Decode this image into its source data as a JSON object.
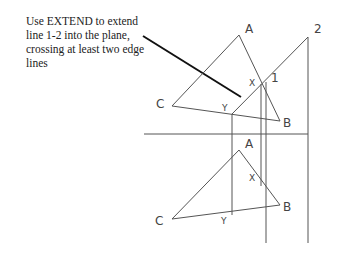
{
  "instruction": {
    "lines": [
      "Use EXTEND to  extend",
      "line 1-2 into the plane,",
      "crossing at least two edge",
      "lines"
    ]
  },
  "top_view": {
    "labels": {
      "A": "A",
      "B": "B",
      "C": "C",
      "X": "X",
      "Y": "Y",
      "one": "1",
      "two": "2"
    }
  },
  "front_view": {
    "labels": {
      "A": "A",
      "B": "B",
      "C": "C",
      "X": "X",
      "Y": "Y"
    }
  }
}
